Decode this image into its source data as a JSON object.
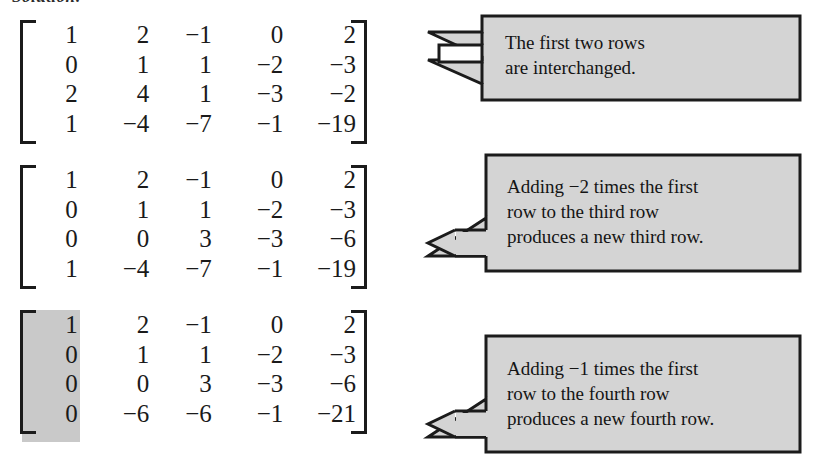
{
  "page": {
    "heading_sliver": "Solution:"
  },
  "matrices": [
    {
      "name": "matrix-step-1",
      "shaded_column": null,
      "rows": [
        [
          "1",
          "2",
          "−1",
          "0",
          "2"
        ],
        [
          "0",
          "1",
          "1",
          "−2",
          "−3"
        ],
        [
          "2",
          "4",
          "1",
          "−3",
          "−2"
        ],
        [
          "1",
          "−4",
          "−7",
          "−1",
          "−19"
        ]
      ]
    },
    {
      "name": "matrix-step-2",
      "shaded_column": null,
      "rows": [
        [
          "1",
          "2",
          "−1",
          "0",
          "2"
        ],
        [
          "0",
          "1",
          "1",
          "−2",
          "−3"
        ],
        [
          "0",
          "0",
          "3",
          "−3",
          "−6"
        ],
        [
          "1",
          "−4",
          "−7",
          "−1",
          "−19"
        ]
      ]
    },
    {
      "name": "matrix-step-3",
      "shaded_column": 0,
      "rows": [
        [
          "1",
          "2",
          "−1",
          "0",
          "2"
        ],
        [
          "0",
          "1",
          "1",
          "−2",
          "−3"
        ],
        [
          "0",
          "0",
          "3",
          "−3",
          "−6"
        ],
        [
          "0",
          "−6",
          "−6",
          "−1",
          "−21"
        ]
      ]
    }
  ],
  "callouts": [
    {
      "name": "callout-interchange",
      "arrow_style": "double-left-arrow",
      "text": "The first two rows\nare interchanged."
    },
    {
      "name": "callout-third-row",
      "arrow_style": "single-left-arrow",
      "text": "Adding −2 times the first\nrow to the third row\nproduces a new third row."
    },
    {
      "name": "callout-fourth-row",
      "arrow_style": "single-left-arrow",
      "text": "Adding −1 times the first\nrow to the fourth row\nproduces a new fourth row."
    }
  ],
  "colors": {
    "box_fill": "#d4d4d4",
    "box_stroke": "#1b1b1b",
    "shade_fill": "#c9c9c9",
    "text": "#141414",
    "page_background": "#ffffff"
  }
}
